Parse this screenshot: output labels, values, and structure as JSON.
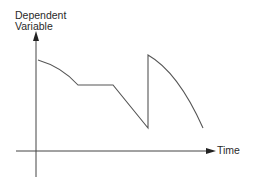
{
  "diagram": {
    "y_axis_label_line1": "Dependent",
    "y_axis_label_line2": "Variable",
    "x_axis_label": "Time",
    "colors": {
      "axis": "#444444",
      "curve": "#555555",
      "text": "#2a2a2a",
      "background": "#ffffff"
    }
  }
}
